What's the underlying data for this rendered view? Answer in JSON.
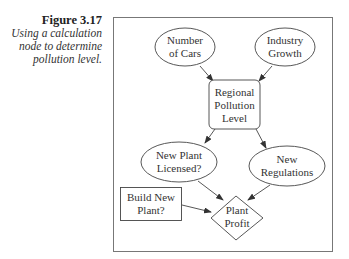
{
  "caption": {
    "title": "Figure 3.17",
    "lines": [
      "Using a calculation",
      "node to determine",
      "pollution level."
    ]
  },
  "diagram": {
    "nodes": [
      {
        "id": "number-of-cars",
        "shape": "ellipse",
        "lines": [
          "Number",
          "of Cars"
        ]
      },
      {
        "id": "industry-growth",
        "shape": "ellipse",
        "lines": [
          "Industry",
          "Growth"
        ]
      },
      {
        "id": "regional-pollution-level",
        "shape": "rounded-rect",
        "lines": [
          "Regional",
          "Pollution",
          "Level"
        ]
      },
      {
        "id": "new-plant-licensed",
        "shape": "ellipse",
        "lines": [
          "New Plant",
          "Licensed?"
        ]
      },
      {
        "id": "new-regulations",
        "shape": "ellipse",
        "lines": [
          "New",
          "Regulations"
        ]
      },
      {
        "id": "build-new-plant",
        "shape": "rect",
        "lines": [
          "Build New",
          "Plant?"
        ]
      },
      {
        "id": "plant-profit",
        "shape": "diamond",
        "lines": [
          "Plant",
          "Profit"
        ]
      }
    ],
    "edges": [
      {
        "from": "number-of-cars",
        "to": "regional-pollution-level"
      },
      {
        "from": "industry-growth",
        "to": "regional-pollution-level"
      },
      {
        "from": "regional-pollution-level",
        "to": "new-plant-licensed"
      },
      {
        "from": "regional-pollution-level",
        "to": "new-regulations"
      },
      {
        "from": "new-plant-licensed",
        "to": "plant-profit"
      },
      {
        "from": "new-regulations",
        "to": "plant-profit"
      },
      {
        "from": "build-new-plant",
        "to": "plant-profit"
      }
    ]
  }
}
